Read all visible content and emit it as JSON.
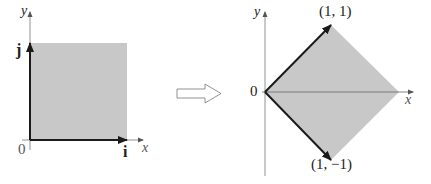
{
  "colors": {
    "fill": "#c8c8c8",
    "axis": "#666666",
    "vector": "#1a1a1a",
    "arrow_outline": "#777777"
  },
  "left_diagram": {
    "axis_x_label": "x",
    "axis_y_label": "y",
    "origin_label": "0",
    "vector_i_label": "i",
    "vector_j_label": "j",
    "region": "unit square"
  },
  "transform_arrow": {
    "icon": "hollow-right-arrow-icon"
  },
  "right_diagram": {
    "axis_x_label": "x",
    "axis_y_label": "y",
    "origin_label": "0",
    "vertex_top_label": "(1, 1)",
    "vertex_bottom_label": "(1, −1)",
    "region": "rotated square (diamond)"
  }
}
